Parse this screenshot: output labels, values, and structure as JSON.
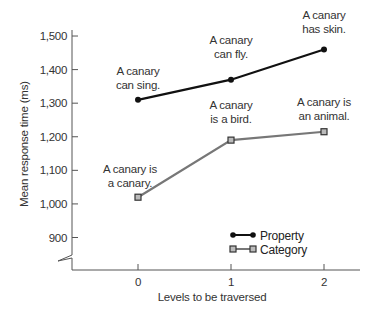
{
  "chart_data": {
    "type": "line",
    "title": "",
    "xlabel": "Levels to be traversed",
    "ylabel": "Mean response time (ms)",
    "x": [
      0,
      1,
      2
    ],
    "x_tick_labels": [
      "0",
      "1",
      "2"
    ],
    "y_ticks": [
      900,
      1000,
      1100,
      1200,
      1300,
      1400,
      1500
    ],
    "y_tick_labels": [
      "900",
      "1,000",
      "1,100",
      "1,200",
      "1,300",
      "1,400",
      "1,500"
    ],
    "ylim": [
      850,
      1520
    ],
    "y_axis_break": true,
    "grid": false,
    "legend_position": "lower-right",
    "series": [
      {
        "name": "Property",
        "color": "#111111",
        "marker": "circle",
        "values": [
          1310,
          1370,
          1460
        ],
        "annotations": [
          [
            "A canary",
            "can sing."
          ],
          [
            "A canary",
            "can fly."
          ],
          [
            "A canary",
            "has skin."
          ]
        ]
      },
      {
        "name": "Category",
        "color": "#777777",
        "marker": "square",
        "values": [
          1020,
          1190,
          1215
        ],
        "annotations": [
          [
            "A canary is",
            "a canary."
          ],
          [
            "A canary",
            "is a bird."
          ],
          [
            "A canary is",
            "an animal."
          ]
        ]
      }
    ]
  }
}
